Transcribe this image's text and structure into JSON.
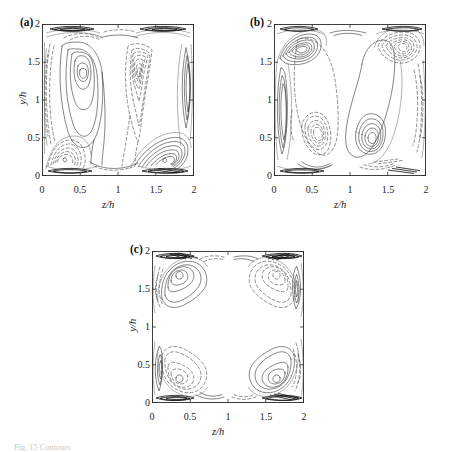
{
  "figure": {
    "background_color": "#ffffff",
    "line_color": "#3a3a3a",
    "frame_color": "#2b2b2b",
    "caption_fragment": "Fig. 15 Contours"
  },
  "axes": {
    "x_title": "z/h",
    "y_title": "y/h",
    "x_ticks": [
      "0",
      "0.5",
      "1",
      "1.5",
      "2"
    ],
    "y_ticks": [
      "0",
      "0.5",
      "1",
      "1.5",
      "2"
    ],
    "x_tick_values": [
      0,
      0.5,
      1,
      1.5,
      2
    ],
    "y_tick_values": [
      0,
      0.5,
      1,
      1.5,
      2
    ],
    "xlim": [
      0,
      2
    ],
    "ylim": [
      0,
      2
    ]
  },
  "panels": [
    {
      "tag": "(a)",
      "show_y_title": true,
      "x_title": "z/h",
      "y_title": "y/h"
    },
    {
      "tag": "(b)",
      "show_y_title": false,
      "x_title": "z/h",
      "y_title": "y/h"
    },
    {
      "tag": "(c)",
      "show_y_title": true,
      "x_title": "z/h",
      "y_title": "y/h"
    }
  ],
  "chart_data": {
    "type": "contour",
    "title": "",
    "subtitle": "",
    "xlabel": "z/h",
    "ylabel": "y/h",
    "xlim": [
      0,
      2
    ],
    "ylim": [
      0,
      2
    ],
    "xticks": [
      0,
      0.5,
      1,
      1.5,
      2
    ],
    "yticks": [
      0,
      0.5,
      1,
      1.5,
      2
    ],
    "grid": false,
    "legend": "none",
    "line_styles": {
      "solid": "positive contour levels",
      "dashed": "negative contour levels"
    },
    "panels": [
      {
        "label": "(a)",
        "features": [
          {
            "kind": "positive-cell",
            "center": [
              0.55,
              1.55
            ],
            "style": "solid",
            "levels": 4,
            "extent": [
              0.25,
              0.85,
              0.25,
              1.95
            ]
          },
          {
            "kind": "negative-cell",
            "center": [
              1.4,
              1.55
            ],
            "style": "dashed",
            "levels": 4,
            "extent": [
              1.15,
              1.65,
              0.45,
              1.95
            ]
          },
          {
            "kind": "positive-corner-vortex",
            "center": [
              1.8,
              0.22
            ],
            "style": "solid",
            "levels": 6
          },
          {
            "kind": "negative-corner-vortex",
            "center": [
              0.22,
              0.22
            ],
            "style": "dashed",
            "levels": 5
          },
          {
            "kind": "wall-layer-top",
            "style": "dense-solid"
          },
          {
            "kind": "wall-layer-bottom",
            "style": "dense-solid"
          },
          {
            "kind": "wall-layer-left",
            "style": "dashed"
          },
          {
            "kind": "wall-layer-right",
            "style": "solid"
          }
        ]
      },
      {
        "label": "(b)",
        "features": [
          {
            "kind": "positive-corner-vortex",
            "center": [
              0.27,
              1.8
            ],
            "style": "solid",
            "levels": 5
          },
          {
            "kind": "negative-corner-vortex",
            "center": [
              1.78,
              1.8
            ],
            "style": "dashed",
            "levels": 5
          },
          {
            "kind": "negative-cell",
            "center": [
              0.52,
              0.46
            ],
            "style": "dashed",
            "levels": 4,
            "extent": [
              0.25,
              0.85,
              0.15,
              1.65
            ]
          },
          {
            "kind": "positive-cell",
            "center": [
              1.45,
              0.46
            ],
            "style": "solid",
            "levels": 4,
            "extent": [
              1.2,
              1.75,
              0.15,
              1.85
            ]
          },
          {
            "kind": "wall-layer-top",
            "style": "dense-solid"
          },
          {
            "kind": "wall-layer-bottom",
            "style": "dense-solid"
          },
          {
            "kind": "wall-layer-left",
            "style": "solid"
          },
          {
            "kind": "wall-layer-right",
            "style": "dashed"
          }
        ]
      },
      {
        "label": "(c)",
        "features": [
          {
            "kind": "positive-corner-lobe",
            "center": [
              0.28,
              1.82
            ],
            "style": "solid",
            "levels": 3,
            "extent": [
              0.1,
              0.95,
              1.45,
              1.98
            ]
          },
          {
            "kind": "negative-corner-lobe",
            "center": [
              1.72,
              1.82
            ],
            "style": "dashed",
            "levels": 3,
            "extent": [
              1.05,
              1.9,
              1.45,
              1.98
            ]
          },
          {
            "kind": "negative-corner-lobe",
            "center": [
              0.3,
              0.18
            ],
            "style": "dashed",
            "levels": 3,
            "extent": [
              0.1,
              0.95,
              0.02,
              0.55
            ]
          },
          {
            "kind": "positive-corner-lobe",
            "center": [
              1.78,
              0.18
            ],
            "style": "solid",
            "levels": 3,
            "extent": [
              1.05,
              1.9,
              0.02,
              0.55
            ]
          },
          {
            "kind": "quiescent-core",
            "center": [
              1.0,
              1.0
            ],
            "style": "none"
          },
          {
            "kind": "wall-layer-top",
            "style": "dense-solid"
          },
          {
            "kind": "wall-layer-bottom",
            "style": "dense-solid"
          }
        ]
      }
    ]
  }
}
